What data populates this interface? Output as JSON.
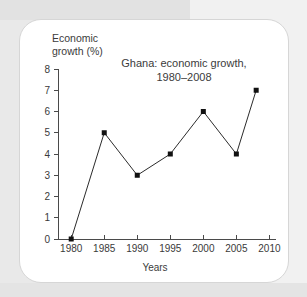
{
  "figure": {
    "y_axis_caption": "Economic\ngrowth (%)",
    "x_axis_caption": "Years",
    "title_line1": "Ghana: economic growth,",
    "title_line2": "1980–2008"
  },
  "colors": {
    "page_background": "#e9e9e9",
    "card_background": "#ffffff",
    "card_border": "#d6d6d6",
    "axis": "#4a4a4a",
    "line": "#2b2b2b",
    "marker": "#111111",
    "text": "#3b3b3b"
  },
  "chart_data": {
    "type": "line",
    "title": "Ghana: economic growth, 1980–2008",
    "xlabel": "Years",
    "ylabel": "Economic growth (%)",
    "x": [
      1980,
      1985,
      1990,
      1995,
      2000,
      2005,
      2008
    ],
    "values": [
      0,
      5,
      3,
      4,
      6,
      4,
      7
    ],
    "xlim": [
      1978,
      2011
    ],
    "ylim": [
      0,
      8
    ],
    "xticks": [
      1980,
      1985,
      1990,
      1995,
      2000,
      2005,
      2010
    ],
    "xtick_labels": [
      "1980",
      "1985",
      "1990",
      "1995",
      "2000",
      "2005",
      "2010"
    ],
    "yticks": [
      0,
      1,
      2,
      3,
      4,
      5,
      6,
      7,
      8
    ],
    "ytick_labels": [
      "0",
      "1",
      "2",
      "3",
      "4",
      "5",
      "6",
      "7",
      "8"
    ],
    "grid": false,
    "legend": false,
    "marker": "square",
    "series": [
      {
        "name": "Economic growth (%)",
        "points": [
          {
            "x": 1980,
            "y": 0
          },
          {
            "x": 1985,
            "y": 5
          },
          {
            "x": 1990,
            "y": 3
          },
          {
            "x": 1995,
            "y": 4
          },
          {
            "x": 2000,
            "y": 6
          },
          {
            "x": 2005,
            "y": 4
          },
          {
            "x": 2008,
            "y": 7
          }
        ]
      }
    ]
  }
}
